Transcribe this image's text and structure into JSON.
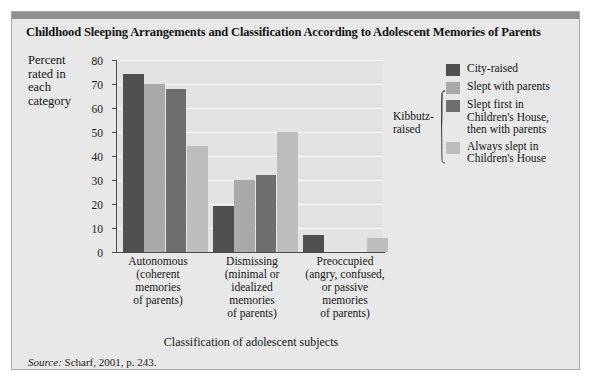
{
  "figure": {
    "title": "Childhood Sleeping Arrangements and Classification According to Adolescent Memories of Parents",
    "source": "Scharf, 2001, p. 243.",
    "source_prefix": "Source:"
  },
  "chart_data": {
    "type": "bar",
    "title": "Childhood Sleeping Arrangements and Classification According to Adolescent Memories of Parents",
    "xlabel": "Classification of adolescent subjects",
    "ylabel": "Percent rated in each category",
    "ylim": [
      0,
      80
    ],
    "yticks": [
      0,
      10,
      20,
      30,
      40,
      50,
      60,
      70,
      80
    ],
    "grid": true,
    "legend_position": "right",
    "group_label": "Kibbutz-raised",
    "categories": [
      "Autonomous\n(coherent\nmemories\nof parents)",
      "Dismissing\n(minimal or\nidealized\nmemories\nof parents)",
      "Preoccupied\n(angry, confused,\nor passive\nmemories\nof parents)"
    ],
    "category_lines": [
      [
        "Autonomous",
        "(coherent",
        "memories",
        "of parents)"
      ],
      [
        "Dismissing",
        "(minimal or",
        "idealized",
        "memories",
        "of parents)"
      ],
      [
        "Preoccupied",
        "(angry, confused,",
        "or passive",
        "memories",
        "of parents)"
      ]
    ],
    "series": [
      {
        "name": "City-raised",
        "color": "#4f4f4f",
        "kibbutz": false,
        "values": [
          74,
          19,
          7
        ]
      },
      {
        "name": "Slept with parents",
        "color": "#a9a9a9",
        "kibbutz": true,
        "values": [
          70,
          30,
          0
        ]
      },
      {
        "name": "Slept first in Children's House, then with parents",
        "name_lines": [
          "Slept first in",
          "Children's House,",
          "then with parents"
        ],
        "color": "#6e6e6e",
        "kibbutz": true,
        "values": [
          68,
          32,
          0
        ]
      },
      {
        "name": "Always slept in Children's House",
        "name_lines": [
          "Always slept in",
          "Children's House"
        ],
        "color": "#bdbdbd",
        "kibbutz": true,
        "values": [
          44,
          50,
          6
        ]
      }
    ]
  },
  "legend": {
    "items": [
      {
        "label": "City-raised",
        "color": "#4f4f4f"
      },
      {
        "label": "Slept with parents",
        "color": "#a9a9a9"
      },
      {
        "label": "Slept first in Children's House, then with parents",
        "color": "#6e6e6e"
      },
      {
        "label": "Always slept in Children's House",
        "color": "#bdbdbd"
      }
    ],
    "bracket_label": "Kibbutz-raised"
  },
  "colors": {
    "panel_bg": "#e8e8e8",
    "plot_bg": "#e3e3e3",
    "grid": "#fafafa",
    "axis": "#4a4a4a",
    "rule": "#8e8e8e",
    "text": "#141414"
  }
}
